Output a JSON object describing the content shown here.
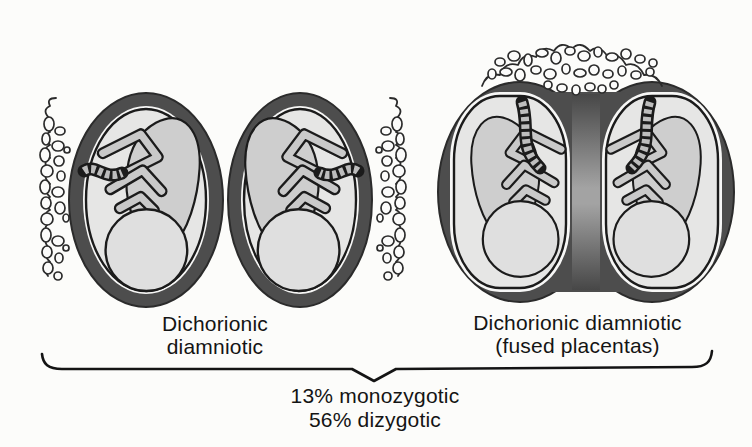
{
  "diagram": {
    "left_pair": {
      "label_line1": "Dichorionic",
      "label_line2": "diamniotic"
    },
    "right_pair": {
      "label_line1": "Dichorionic diamniotic",
      "label_line2": "(fused placentas)"
    },
    "caption": {
      "line1": "13% monozygotic",
      "line2": "56% dizygotic"
    },
    "stats": {
      "monozygotic_pct": "13%",
      "dizygotic_pct": "56%"
    },
    "colors": {
      "bg": "#fcfcfa",
      "ink": "#141414",
      "line": "#1b1b1b",
      "edge": "#2b2b2b",
      "chorion": "#4d4d4d",
      "gap": "#f7f7f6",
      "fluid": "#e6e6e5",
      "torso": "#cecece",
      "head": "#dfdfdf",
      "limb": "#c9c9c9",
      "cord": "#bdbdbd",
      "lump": "#fbfbfa",
      "septum_dark": "#474747",
      "septum_mid": "#a3a3a3"
    }
  }
}
